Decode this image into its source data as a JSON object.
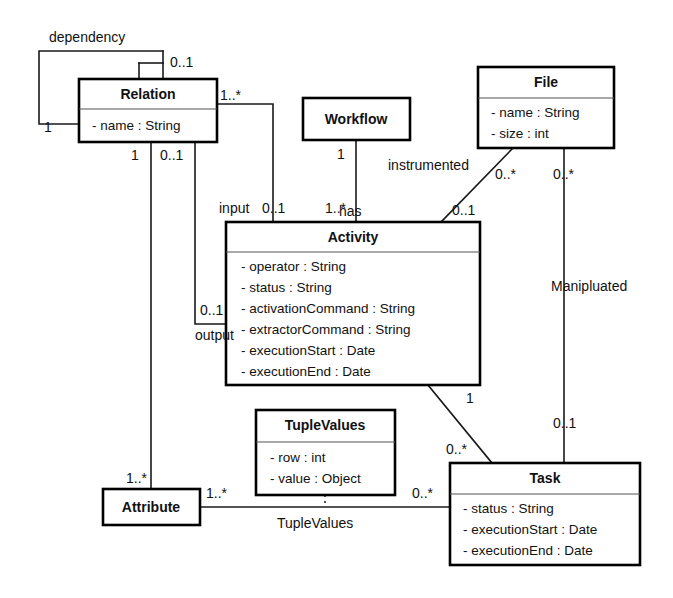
{
  "diagram": {
    "kind": "uml-class-diagram",
    "title": "",
    "background_color": "#ffffff",
    "line_color": "#1a1a1a",
    "text_color": "#111111"
  },
  "classes": [
    {
      "id": "relation",
      "name": "Relation",
      "attributes": [
        "- name : String"
      ],
      "x": 79,
      "y": 79,
      "w": 138,
      "h": 63,
      "header_h": 30
    },
    {
      "id": "workflow",
      "name": "Workflow",
      "attributes": [],
      "x": 303,
      "y": 98,
      "w": 107,
      "h": 42,
      "header_h": 42
    },
    {
      "id": "file",
      "name": "File",
      "attributes": [
        "- name : String",
        "- size : int"
      ],
      "x": 478,
      "y": 67,
      "w": 136,
      "h": 81,
      "header_h": 31
    },
    {
      "id": "activity",
      "name": "Activity",
      "attributes": [
        "- operator : String",
        "- status : String",
        "- activationCommand : String",
        "- extractorCommand : String",
        "- executionStart : Date",
        "- executionEnd : Date"
      ],
      "x": 226,
      "y": 222,
      "w": 254,
      "h": 163,
      "header_h": 30
    },
    {
      "id": "tuplevalues",
      "name": "TupleValues",
      "attributes": [
        "- row : int",
        "- value : Object"
      ],
      "x": 256,
      "y": 410,
      "w": 139,
      "h": 85,
      "header_h": 32
    },
    {
      "id": "attribute",
      "name": "Attribute",
      "attributes": [],
      "x": 103,
      "y": 489,
      "w": 97,
      "h": 36,
      "header_h": 36
    },
    {
      "id": "task",
      "name": "Task",
      "attributes": [
        "- status : String",
        "- executionStart : Date",
        "- executionEnd : Date"
      ],
      "x": 450,
      "y": 463,
      "w": 190,
      "h": 102,
      "header_h": 31
    }
  ],
  "associations": [
    {
      "id": "relation-dependency-self",
      "name": "dependency",
      "from": "relation",
      "to": "relation",
      "from_multiplicity": "0..1",
      "to_multiplicity": "1"
    },
    {
      "id": "relation-activity-input",
      "name": "input",
      "from": "relation",
      "to": "activity",
      "from_multiplicity": "1..*",
      "to_multiplicity": "0..1"
    },
    {
      "id": "relation-activity-output",
      "name": "output",
      "from": "relation",
      "to": "activity",
      "from_multiplicity": "0..1",
      "to_multiplicity": "0..1"
    },
    {
      "id": "relation-attribute",
      "name": "",
      "from": "relation",
      "to": "attribute",
      "from_multiplicity": "1",
      "to_multiplicity": "1..*"
    },
    {
      "id": "workflow-activity-has",
      "name": "has",
      "from": "workflow",
      "to": "activity",
      "from_multiplicity": "1",
      "to_multiplicity": "1..*"
    },
    {
      "id": "file-activity-instrumented",
      "name": "instrumented",
      "from": "file",
      "to": "activity",
      "from_multiplicity": "0..*",
      "to_multiplicity": "0..1"
    },
    {
      "id": "file-task-manipluated",
      "name": "Manipluated",
      "from": "file",
      "to": "task",
      "from_multiplicity": "0..*",
      "to_multiplicity": "0..1"
    },
    {
      "id": "activity-task",
      "name": "",
      "from": "activity",
      "to": "task",
      "from_multiplicity": "1",
      "to_multiplicity": "0..*"
    },
    {
      "id": "attribute-task-tuplevalues",
      "name": "TupleValues",
      "from": "attribute",
      "to": "task",
      "from_multiplicity": "1..*",
      "to_multiplicity": "0..*",
      "association_class": "tuplevalues"
    }
  ],
  "labels": {
    "dependency": "dependency",
    "input": "input",
    "output": "output",
    "has": "has",
    "instrumented": "instrumented",
    "manipluated": "Manipluated",
    "tuplevalues_assoc": "TupleValues",
    "m_dep_top": "0..1",
    "m_dep_left": "1",
    "m_relation_right": "1..*",
    "m_relation_bottom_left": "1",
    "m_relation_bottom_right": "0..1",
    "m_input": "0..1",
    "m_output": "0..1",
    "m_workflow": "1",
    "m_activity_top": "1..*",
    "m_file_left": "0..*",
    "m_file_right": "0..*",
    "m_activity_instrumented": "0..1",
    "m_activity_task": "1",
    "m_task_activity": "0..*",
    "m_task_file": "0..1",
    "m_attribute_top": "1..*",
    "m_attribute_right": "1..*",
    "m_task_left": "0..*"
  }
}
